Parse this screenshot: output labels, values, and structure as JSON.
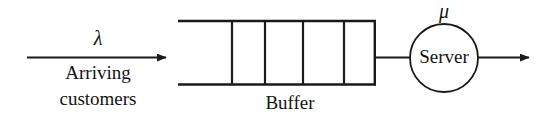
{
  "diagram": {
    "background_color": "#ffffff",
    "stroke_color": "#1a1a1a",
    "text_color": "#141414",
    "arrival": {
      "rate_symbol": "λ",
      "label_line1": "Arriving",
      "label_line2": "customers",
      "arrow_name": "arrival-arrow"
    },
    "buffer": {
      "label": "Buffer",
      "cell_count": 5,
      "divider_count": 4,
      "left_open": true,
      "x": 178,
      "y": 20,
      "width": 197,
      "height": 65,
      "divider_x": [
        232,
        265,
        303,
        344
      ]
    },
    "server": {
      "label": "Server",
      "rate_symbol": "μ",
      "center_x": 444,
      "center_y": 58,
      "radius": 34
    },
    "departure": {
      "arrow_name": "departure-arrow"
    },
    "connector": {
      "from": "buffer-right-edge",
      "to": "server-circle"
    }
  }
}
